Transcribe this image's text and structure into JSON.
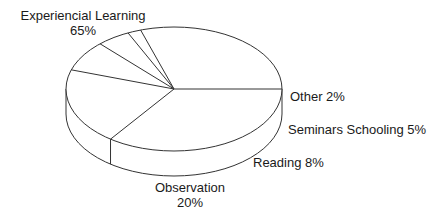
{
  "chart_data": {
    "type": "pie",
    "style": "3d-outline",
    "title": "",
    "slices": [
      {
        "label": "Experiencial Learning",
        "value": 65,
        "value_label": "65%"
      },
      {
        "label": "Observation",
        "value": 20,
        "value_label": "20%"
      },
      {
        "label": "Reading",
        "value": 8,
        "value_label": "8%"
      },
      {
        "label": "Seminars Schooling",
        "value": 5,
        "value_label": "5%"
      },
      {
        "label": "Other",
        "value": 2,
        "value_label": "2%"
      }
    ],
    "legend": "none",
    "colors": {
      "stroke": "#333333",
      "fill": "#ffffff"
    }
  },
  "labels": {
    "experiential": {
      "name": "Experiencial Learning",
      "pct": "65%"
    },
    "observation": {
      "name": "Observation",
      "pct": "20%"
    },
    "reading": "Reading 8%",
    "seminars": "Seminars Schooling 5%",
    "other": "Other 2%"
  }
}
